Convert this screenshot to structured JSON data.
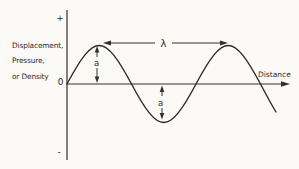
{
  "figure": {
    "background_color": "#fbfaf7",
    "ink_color": "#2e2b28",
    "y_axis": {
      "positive_label": "+",
      "origin_label": "0",
      "negative_label": "-",
      "title_lines": [
        "Displacement,",
        "Pressure,",
        "or Density"
      ]
    },
    "x_axis": {
      "label": "Distance"
    },
    "wave": {
      "wavelength_label": "λ",
      "amplitude_labels": {
        "peak": "a",
        "trough": "a"
      }
    }
  }
}
